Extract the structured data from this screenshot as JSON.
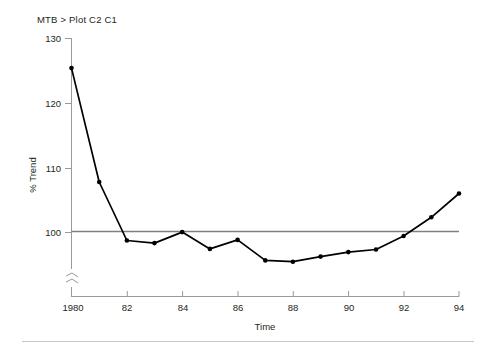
{
  "margin_marks": [
    "'",
    "'"
  ],
  "header": {
    "command_title": "MTB > Plot C2 C1"
  },
  "chart_data": {
    "type": "line",
    "title": "MTB > Plot C2 C1",
    "xlabel": "Time",
    "ylabel": "% Trend",
    "x": [
      1980,
      1981,
      1982,
      1983,
      1984,
      1985,
      1986,
      1987,
      1988,
      1989,
      1990,
      1991,
      1992,
      1993,
      1994
    ],
    "xtick_values": [
      1980,
      1982,
      1984,
      1986,
      1988,
      1990,
      1992,
      1994
    ],
    "xtick_labels": [
      "1980",
      "82",
      "84",
      "86",
      "88",
      "90",
      "92",
      "94"
    ],
    "ytick_values": [
      100,
      110,
      120,
      130
    ],
    "ytick_labels": [
      "100",
      "110",
      "120",
      "130"
    ],
    "xlim": [
      1980,
      1994
    ],
    "ylim": [
      94.5,
      130
    ],
    "axis_break": true,
    "axis_break_label": "",
    "grid": false,
    "legend": null,
    "series": [
      {
        "name": "% Trend",
        "color": "#000000",
        "marker": "filled-circle",
        "values": [
          125.4,
          107.7,
          98.6,
          98.2,
          99.9,
          97.3,
          98.7,
          95.5,
          95.3,
          96.1,
          96.8,
          97.2,
          99.3,
          102.2,
          105.9
        ]
      }
    ],
    "reference_line": {
      "name": "baseline-100",
      "y": 100,
      "color": "#808080"
    }
  },
  "footer": {
    "divider": ""
  }
}
